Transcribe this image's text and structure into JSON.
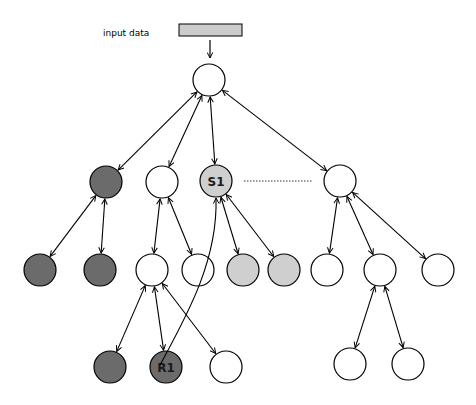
{
  "diagram": {
    "input_label": "input data",
    "colors": {
      "dark": "#6b6b6b",
      "light": "#cfcfcf",
      "white": "#ffffff",
      "input_box": "#cccccc",
      "stroke": "#000000"
    },
    "nodes": [
      {
        "id": "root",
        "x": 209,
        "y": 80,
        "fill": "white",
        "label": ""
      },
      {
        "id": "a",
        "x": 106,
        "y": 182,
        "fill": "dark",
        "label": ""
      },
      {
        "id": "b",
        "x": 162,
        "y": 182,
        "fill": "white",
        "label": ""
      },
      {
        "id": "s1",
        "x": 216,
        "y": 181,
        "fill": "light",
        "label": "S1"
      },
      {
        "id": "c",
        "x": 340,
        "y": 181,
        "fill": "white",
        "label": ""
      },
      {
        "id": "a1",
        "x": 40,
        "y": 270,
        "fill": "dark",
        "label": ""
      },
      {
        "id": "a2",
        "x": 100,
        "y": 270,
        "fill": "dark",
        "label": ""
      },
      {
        "id": "b1",
        "x": 152,
        "y": 270,
        "fill": "white",
        "label": ""
      },
      {
        "id": "b2",
        "x": 198,
        "y": 270,
        "fill": "white",
        "label": ""
      },
      {
        "id": "s1a",
        "x": 243,
        "y": 270,
        "fill": "light",
        "label": ""
      },
      {
        "id": "s1b",
        "x": 284,
        "y": 270,
        "fill": "light",
        "label": ""
      },
      {
        "id": "c1",
        "x": 327,
        "y": 270,
        "fill": "white",
        "label": ""
      },
      {
        "id": "c2",
        "x": 380,
        "y": 270,
        "fill": "white",
        "label": ""
      },
      {
        "id": "c3",
        "x": 438,
        "y": 270,
        "fill": "white",
        "label": ""
      },
      {
        "id": "b1a",
        "x": 110,
        "y": 367,
        "fill": "dark",
        "label": ""
      },
      {
        "id": "r1",
        "x": 166,
        "y": 367,
        "fill": "dark",
        "label": "R1"
      },
      {
        "id": "b1c",
        "x": 226,
        "y": 367,
        "fill": "white",
        "label": ""
      },
      {
        "id": "c2a",
        "x": 350,
        "y": 364,
        "fill": "white",
        "label": ""
      },
      {
        "id": "c2b",
        "x": 408,
        "y": 364,
        "fill": "white",
        "label": ""
      }
    ],
    "edges": [
      {
        "from": "root",
        "to": "a",
        "type": "bidirectional"
      },
      {
        "from": "root",
        "to": "b",
        "type": "bidirectional"
      },
      {
        "from": "root",
        "to": "s1",
        "type": "bidirectional"
      },
      {
        "from": "root",
        "to": "c",
        "type": "bidirectional"
      },
      {
        "from": "a",
        "to": "a1",
        "type": "bidirectional"
      },
      {
        "from": "a",
        "to": "a2",
        "type": "bidirectional"
      },
      {
        "from": "b",
        "to": "b1",
        "type": "bidirectional"
      },
      {
        "from": "b",
        "to": "b2",
        "type": "bidirectional"
      },
      {
        "from": "s1",
        "to": "s1a",
        "type": "bidirectional"
      },
      {
        "from": "s1",
        "to": "s1b",
        "type": "bidirectional"
      },
      {
        "from": "c",
        "to": "c1",
        "type": "bidirectional"
      },
      {
        "from": "c",
        "to": "c2",
        "type": "bidirectional"
      },
      {
        "from": "c",
        "to": "c3",
        "type": "bidirectional"
      },
      {
        "from": "b1",
        "to": "b1a",
        "type": "bidirectional"
      },
      {
        "from": "b1",
        "to": "r1",
        "type": "bidirectional"
      },
      {
        "from": "b1",
        "to": "b1c",
        "type": "bidirectional"
      },
      {
        "from": "c2",
        "to": "c2a",
        "type": "bidirectional"
      },
      {
        "from": "c2",
        "to": "c2b",
        "type": "bidirectional"
      },
      {
        "from": "r1",
        "to": "s1",
        "type": "curved-arrow"
      },
      {
        "from": "s1",
        "to": "c",
        "type": "dotted"
      }
    ]
  }
}
